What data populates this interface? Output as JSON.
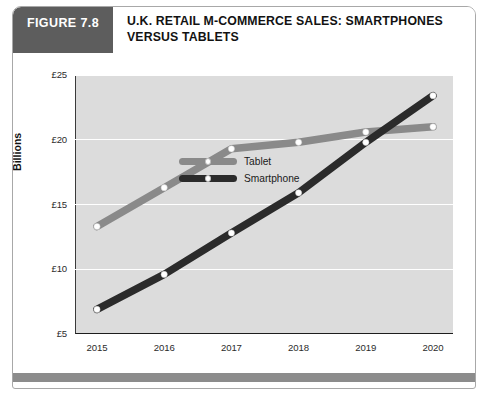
{
  "figure": {
    "tag_label": "FIGURE 7.8",
    "title": "U.K. RETAIL M-COMMERCE SALES: SMARTPHONES VERSUS TABLETS",
    "tag_bg_color": "#5d5d5d",
    "footer_bar_color": "#8c8c8c",
    "plot_bg_color": "#dcdcdc"
  },
  "chart_data": {
    "type": "line",
    "title": "U.K. RETAIL M-COMMERCE SALES: SMARTPHONES VERSUS TABLETS",
    "xlabel": "",
    "ylabel": "Billions",
    "categories": [
      "2015",
      "2016",
      "2017",
      "2018",
      "2019",
      "2020"
    ],
    "series": [
      {
        "name": "Tablet",
        "color": "#8a8a8a",
        "marker": "white-dot",
        "values": [
          13.3,
          16.3,
          19.3,
          19.8,
          20.6,
          21.0
        ]
      },
      {
        "name": "Smartphone",
        "color": "#2b2b2b",
        "marker": "white-dot",
        "values": [
          6.9,
          9.6,
          12.8,
          15.9,
          19.8,
          23.4
        ]
      }
    ],
    "ylim": [
      5,
      25
    ],
    "yticks": [
      5,
      10,
      15,
      20,
      25
    ],
    "ytick_labels": [
      "£5",
      "£10",
      "£15",
      "£20",
      "£25"
    ],
    "grid": true,
    "grid_color": "#ffffff",
    "legend_position": "top-left-inside"
  },
  "axis": {
    "y_title": "Billions",
    "y_labels": [
      "£25",
      "£20",
      "£15",
      "£10",
      "£5"
    ],
    "x_labels": [
      "2015",
      "2016",
      "2017",
      "2018",
      "2019",
      "2020"
    ]
  },
  "legend": {
    "items": [
      {
        "label": "Tablet",
        "color": "#8a8a8a"
      },
      {
        "label": "Smartphone",
        "color": "#2b2b2b"
      }
    ]
  }
}
